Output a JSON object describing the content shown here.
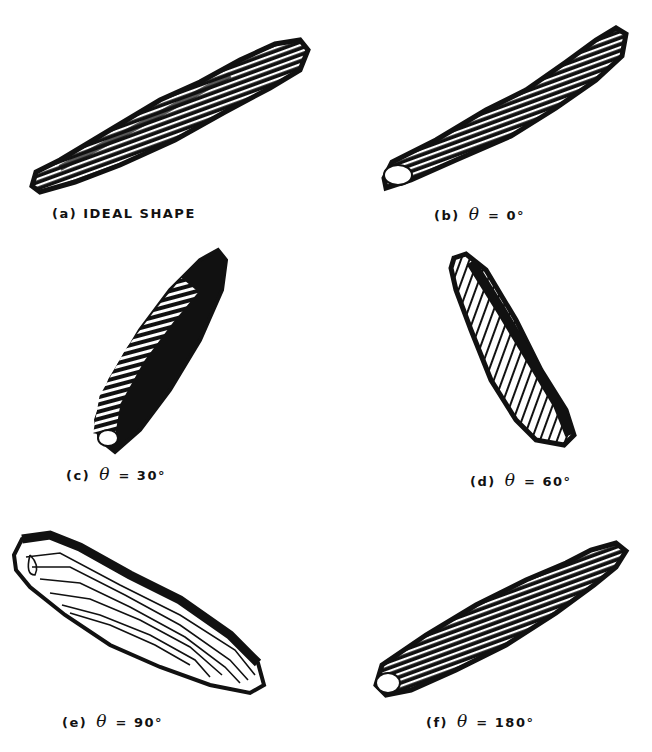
{
  "figure": {
    "panels": [
      {
        "id": "a",
        "label": "(a)",
        "text": "IDEAL SHAPE",
        "theta": null,
        "angle": ""
      },
      {
        "id": "b",
        "label": "(b)",
        "text": "",
        "theta": "θ",
        "eq": "=",
        "angle": "0°"
      },
      {
        "id": "c",
        "label": "(c)",
        "text": "",
        "theta": "θ",
        "eq": "=",
        "angle": "30°"
      },
      {
        "id": "d",
        "label": "(d)",
        "text": "",
        "theta": "θ",
        "eq": "=",
        "angle": "60°"
      },
      {
        "id": "e",
        "label": "(e)",
        "text": "",
        "theta": "θ",
        "eq": "=",
        "angle": "90°"
      },
      {
        "id": "f",
        "label": "(f)",
        "text": "",
        "theta": "θ",
        "eq": "=",
        "angle": "180°"
      }
    ],
    "colors": {
      "ink": "#111111",
      "paper": "#ffffff"
    }
  }
}
